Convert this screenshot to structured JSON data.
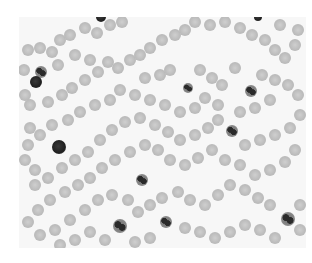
{
  "image": {
    "subject": "blood smear micrograph",
    "tone": "grayscale",
    "bounds": {
      "x": 19,
      "y": 17,
      "w": 287,
      "h": 231
    },
    "background_color": "#f7f7f7",
    "rbc_color": "#bdbdbd",
    "wbc_color": "#222222"
  },
  "wbc": [
    {
      "x": 41,
      "y": 72,
      "r": 6,
      "lobed": true
    },
    {
      "x": 36,
      "y": 82,
      "r": 6,
      "lobed": false
    },
    {
      "x": 101,
      "y": 17,
      "r": 5,
      "lobed": false
    },
    {
      "x": 258,
      "y": 17,
      "r": 4,
      "lobed": false
    },
    {
      "x": 188,
      "y": 88,
      "r": 5,
      "lobed": true
    },
    {
      "x": 251,
      "y": 91,
      "r": 6,
      "lobed": true
    },
    {
      "x": 232,
      "y": 131,
      "r": 6,
      "lobed": true
    },
    {
      "x": 59,
      "y": 147,
      "r": 7,
      "lobed": false
    },
    {
      "x": 142,
      "y": 180,
      "r": 6,
      "lobed": true
    },
    {
      "x": 120,
      "y": 226,
      "r": 7,
      "lobed": true
    },
    {
      "x": 166,
      "y": 222,
      "r": 6,
      "lobed": true
    },
    {
      "x": 288,
      "y": 219,
      "r": 7,
      "lobed": true
    }
  ],
  "rbc": [
    [
      28,
      50
    ],
    [
      40,
      48
    ],
    [
      52,
      52
    ],
    [
      60,
      40
    ],
    [
      70,
      35
    ],
    [
      85,
      28
    ],
    [
      97,
      33
    ],
    [
      110,
      25
    ],
    [
      122,
      22
    ],
    [
      75,
      55
    ],
    [
      90,
      60
    ],
    [
      58,
      65
    ],
    [
      25,
      95
    ],
    [
      30,
      105
    ],
    [
      48,
      102
    ],
    [
      62,
      95
    ],
    [
      72,
      88
    ],
    [
      85,
      80
    ],
    [
      98,
      72
    ],
    [
      108,
      62
    ],
    [
      118,
      68
    ],
    [
      130,
      60
    ],
    [
      140,
      55
    ],
    [
      150,
      48
    ],
    [
      162,
      40
    ],
    [
      175,
      35
    ],
    [
      185,
      30
    ],
    [
      195,
      22
    ],
    [
      210,
      25
    ],
    [
      225,
      22
    ],
    [
      240,
      28
    ],
    [
      252,
      35
    ],
    [
      265,
      40
    ],
    [
      275,
      50
    ],
    [
      285,
      58
    ],
    [
      295,
      45
    ],
    [
      298,
      30
    ],
    [
      280,
      25
    ],
    [
      145,
      78
    ],
    [
      160,
      75
    ],
    [
      170,
      70
    ],
    [
      200,
      70
    ],
    [
      212,
      78
    ],
    [
      222,
      85
    ],
    [
      235,
      68
    ],
    [
      262,
      75
    ],
    [
      275,
      80
    ],
    [
      288,
      85
    ],
    [
      298,
      95
    ],
    [
      270,
      100
    ],
    [
      255,
      108
    ],
    [
      240,
      112
    ],
    [
      218,
      105
    ],
    [
      205,
      98
    ],
    [
      195,
      108
    ],
    [
      180,
      112
    ],
    [
      165,
      105
    ],
    [
      150,
      100
    ],
    [
      135,
      95
    ],
    [
      120,
      90
    ],
    [
      110,
      100
    ],
    [
      95,
      105
    ],
    [
      80,
      112
    ],
    [
      68,
      120
    ],
    [
      52,
      125
    ],
    [
      40,
      135
    ],
    [
      28,
      145
    ],
    [
      25,
      160
    ],
    [
      35,
      170
    ],
    [
      48,
      178
    ],
    [
      62,
      168
    ],
    [
      75,
      160
    ],
    [
      88,
      152
    ],
    [
      100,
      140
    ],
    [
      112,
      130
    ],
    [
      125,
      122
    ],
    [
      140,
      118
    ],
    [
      155,
      125
    ],
    [
      168,
      132
    ],
    [
      180,
      140
    ],
    [
      195,
      135
    ],
    [
      208,
      128
    ],
    [
      218,
      120
    ],
    [
      245,
      145
    ],
    [
      260,
      140
    ],
    [
      275,
      135
    ],
    [
      290,
      128
    ],
    [
      300,
      115
    ],
    [
      295,
      150
    ],
    [
      285,
      162
    ],
    [
      270,
      170
    ],
    [
      255,
      175
    ],
    [
      240,
      165
    ],
    [
      225,
      160
    ],
    [
      212,
      150
    ],
    [
      198,
      158
    ],
    [
      185,
      165
    ],
    [
      170,
      160
    ],
    [
      158,
      150
    ],
    [
      145,
      145
    ],
    [
      130,
      152
    ],
    [
      115,
      160
    ],
    [
      102,
      168
    ],
    [
      90,
      178
    ],
    [
      78,
      185
    ],
    [
      65,
      192
    ],
    [
      50,
      200
    ],
    [
      38,
      210
    ],
    [
      28,
      222
    ],
    [
      40,
      235
    ],
    [
      55,
      230
    ],
    [
      70,
      220
    ],
    [
      85,
      210
    ],
    [
      98,
      200
    ],
    [
      112,
      195
    ],
    [
      128,
      200
    ],
    [
      138,
      212
    ],
    [
      150,
      205
    ],
    [
      162,
      198
    ],
    [
      178,
      192
    ],
    [
      190,
      200
    ],
    [
      205,
      205
    ],
    [
      218,
      195
    ],
    [
      230,
      185
    ],
    [
      245,
      190
    ],
    [
      258,
      198
    ],
    [
      270,
      205
    ],
    [
      300,
      205
    ],
    [
      300,
      230
    ],
    [
      275,
      238
    ],
    [
      260,
      230
    ],
    [
      245,
      225
    ],
    [
      230,
      232
    ],
    [
      215,
      238
    ],
    [
      200,
      232
    ],
    [
      185,
      228
    ],
    [
      150,
      238
    ],
    [
      135,
      242
    ],
    [
      105,
      240
    ],
    [
      90,
      232
    ],
    [
      75,
      240
    ],
    [
      60,
      245
    ],
    [
      35,
      185
    ],
    [
      30,
      128
    ],
    [
      24,
      70
    ]
  ]
}
